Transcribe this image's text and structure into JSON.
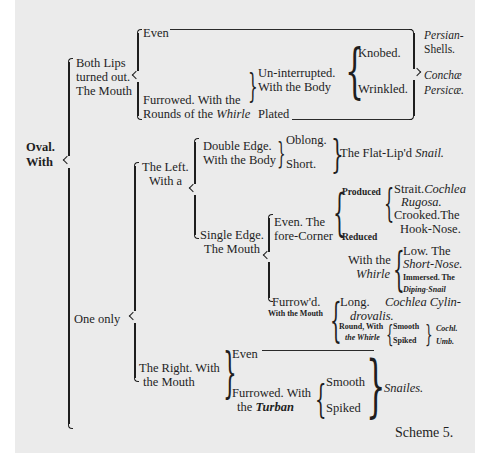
{
  "root": {
    "line1": "Oval.",
    "line2": "With"
  },
  "both_lips": {
    "label_line1": "Both Lips",
    "label_line2": "turned out.",
    "label_line3": "The Mouth",
    "even": "Even",
    "furrowed_line1": "Furrowed.  With the",
    "furrowed_line2_pre": "Rounds of the ",
    "furrowed_line2_italic": "Whirle",
    "uninterrupted_line1": "Un-interrupted.",
    "uninterrupted_line2": "With  the  Body",
    "plated": "Plated",
    "knobed": "Knobed.",
    "wrinkled": "Wrinkled.",
    "result_line1": "Persian-",
    "result_line2": "Shells.",
    "result_line3": "Conchæ",
    "result_line4": "Persicæ."
  },
  "one_only": {
    "label": "One only",
    "left": {
      "label_line1": "The Left.",
      "label_line2": "With a",
      "double_edge_line1": "Double  Edge.",
      "double_edge_line2": "With the Body",
      "oblong": "Oblong.",
      "short": "Short.",
      "flat_lipd_pre": "The Flat-Lip'd ",
      "flat_lipd_italic": "Snail.",
      "single_edge_line1": "Single Edge.",
      "single_edge_line2": "The Mouth",
      "even_line1": "Even.  The",
      "even_line2": "fore-Corner",
      "produced": "Produced",
      "reduced": "Reduced",
      "strait_pre": "Strait.",
      "strait_italic": "Cochlea",
      "rugosa": "Rugosa.",
      "crooked_line1": "Crooked.The",
      "crooked_line2": "Hook-Nose.",
      "with_the_whirle_line1": "With the",
      "with_the_whirle_line2": "Whirle",
      "low_line1": "Low.  The",
      "low_line2": "Short-Nose.",
      "immersed_line1": "Immersed. The",
      "immersed_line2": "Diping-Snail",
      "furrowd_line1": "Furrow'd.",
      "furrowd_line2": "With the Mouth",
      "long": "Long.",
      "cochlea_cyl_line1": "Cochlea  Cylin-",
      "cochlea_cyl_line2": "drovalis.",
      "round_line1": "Round, With",
      "round_line2": "the Whirle",
      "smooth": "Smooth",
      "spiked": "Spiked",
      "cochl_line1": "Cochl.",
      "cochl_line2": "Umb."
    },
    "right": {
      "label_line1": "The Right. With",
      "label_line2": "the Mouth",
      "even": "Even",
      "furrowed_line1": "Furrowed. With",
      "furrowed_line2_pre": "the ",
      "furrowed_line2_italic": "Turban",
      "smooth": "Smooth",
      "spiked": "Spiked",
      "result": "Snailes."
    }
  },
  "caption": "Scheme 5."
}
